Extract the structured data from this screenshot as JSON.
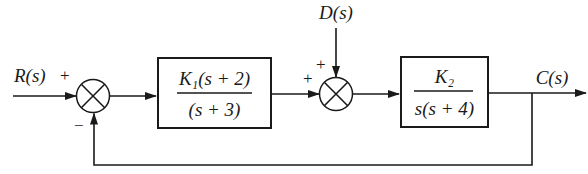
{
  "diagram": {
    "type": "feedback-block-diagram",
    "signals": {
      "input": "R(s)",
      "disturbance": "D(s)",
      "output": "C(s)"
    },
    "summing_junctions": [
      {
        "id": "sum1",
        "signs": {
          "reference": "+",
          "feedback": "−"
        }
      },
      {
        "id": "sum2",
        "signs": {
          "forward": "+",
          "disturbance": "+"
        }
      }
    ],
    "blocks": [
      {
        "id": "block1",
        "numerator": "K₁(s + 2)",
        "denominator": "(s + 3)"
      },
      {
        "id": "block2",
        "numerator": "K₂",
        "denominator": "s(s + 4)"
      }
    ],
    "feedback": "unity negative feedback from C(s) to first summing junction"
  },
  "labels": {
    "r": "R(s)",
    "d": "D(s)",
    "c": "C(s)",
    "sum1_plus": "+",
    "sum1_minus": "−",
    "sum2_plus_left": "+",
    "sum2_plus_top": "+",
    "b1_num": "K₁(s + 2)",
    "b1_den": "(s + 3)",
    "b2_num": "K₂",
    "b2_den": "s(s + 4)"
  }
}
